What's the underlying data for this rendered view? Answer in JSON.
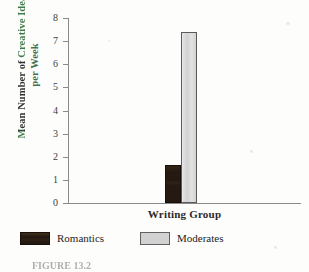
{
  "chart_data": {
    "type": "bar",
    "title": "",
    "xlabel": "Writing Group",
    "ylabel": "Mean Number of Creative Ideas per Week",
    "ylabel_lines": [
      "Mean Number of Creative Ideas",
      "per Week"
    ],
    "categories": [
      "Writing Group"
    ],
    "series": [
      {
        "name": "Romantics",
        "values": [
          1.65
        ],
        "color": "#241a12"
      },
      {
        "name": "Moderates",
        "values": [
          7.4
        ],
        "color": "#d2d2d2"
      }
    ],
    "ylim": [
      0,
      8
    ],
    "ytick_labels": [
      "8",
      "7",
      "6",
      "5",
      "4",
      "3",
      "2",
      "1",
      "0"
    ],
    "ytick_values": [
      8,
      7,
      6,
      5,
      4,
      3,
      2,
      1,
      0
    ],
    "grid": false,
    "legend_position": "bottom"
  },
  "legend": {
    "items": [
      {
        "label": "Romantics",
        "color": "#241a12"
      },
      {
        "label": "Moderates",
        "color": "#d2d2d2"
      }
    ]
  },
  "caption": {
    "text": "FIGURE 13.2"
  }
}
